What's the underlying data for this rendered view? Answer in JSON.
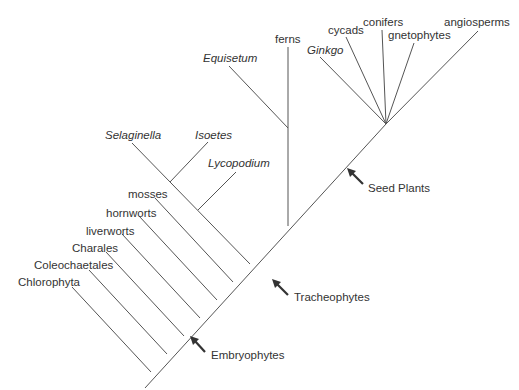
{
  "figure": {
    "type": "cladogram",
    "line_color": "#555555",
    "text_color": "#333333"
  },
  "taxa": {
    "chlorophyta": "Chlorophyta",
    "coleochaetales": "Coleochaetales",
    "charales": "Charales",
    "liverworts": "liverworts",
    "hornworts": "hornworts",
    "mosses": "mosses",
    "selaginella": "Selaginella",
    "isoetes": "Isoetes",
    "lycopodium": "Lycopodium",
    "equisetum": "Equisetum",
    "ferns": "ferns",
    "ginkgo": "Ginkgo",
    "cycads": "cycads",
    "conifers": "conifers",
    "gnetophytes": "gnetophytes",
    "angiosperms": "angiosperms"
  },
  "clade_markers": {
    "embryophytes": "Embryophytes",
    "tracheophytes": "Tracheophytes",
    "seed_plants": "Seed Plants"
  }
}
